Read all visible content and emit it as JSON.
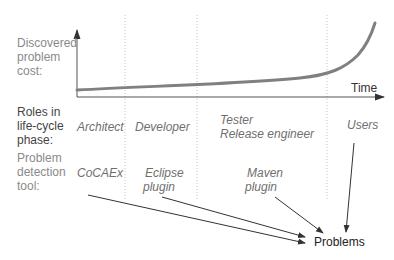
{
  "axes": {
    "y_label": [
      "Discovered",
      "problem",
      "cost:"
    ],
    "x_label": "Time"
  },
  "rows": {
    "roles_label": [
      "Roles in",
      "life-cycle",
      "phase:"
    ],
    "tools_label": [
      "Problem",
      "detection",
      "tool:"
    ]
  },
  "phases": [
    {
      "role": "Architect",
      "tool": [
        "CoCAEx"
      ]
    },
    {
      "role": "Developer",
      "tool": [
        "Eclipse",
        "plugin"
      ]
    },
    {
      "role": [
        "Tester",
        "Release engineer"
      ],
      "tool": [
        "Maven",
        "plugin"
      ]
    },
    {
      "role": "Users",
      "tool": []
    }
  ],
  "target": "Problems",
  "colors": {
    "curve": "#7f7f7f",
    "axis": "#333333",
    "divider": "#bfbfbf",
    "label": "#8a8a8a",
    "italic_text": "#6f6f6f"
  }
}
